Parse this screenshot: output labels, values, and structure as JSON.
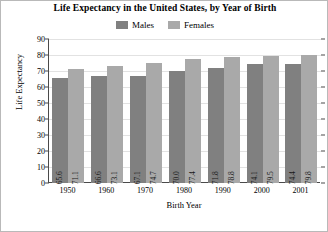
{
  "chart_data": {
    "type": "bar",
    "title": "Life Expectancy in the United States, by Year of Birth",
    "xlabel": "Birth Year",
    "ylabel": "Life Expectancy",
    "categories": [
      "1950",
      "1960",
      "1970",
      "1980",
      "1990",
      "2000",
      "2001"
    ],
    "series": [
      {
        "name": "Males",
        "color": "#808080",
        "values": [
          65.6,
          66.6,
          67.1,
          70.0,
          71.8,
          74.1,
          74.4
        ],
        "labels": [
          "65.6",
          "66.6",
          "67.1",
          "70.0",
          "71.8",
          "74.1",
          "74.4"
        ]
      },
      {
        "name": "Females",
        "color": "#a9a9a9",
        "values": [
          71.1,
          73.1,
          74.7,
          77.4,
          78.8,
          79.5,
          79.8
        ],
        "labels": [
          "71.1",
          "73.1",
          "74.7",
          "77.4",
          "78.8",
          "79.5",
          "79.8"
        ]
      }
    ],
    "ylim": [
      0,
      90
    ],
    "yticks": [
      0,
      10,
      20,
      30,
      40,
      50,
      60,
      70,
      80,
      90
    ],
    "ytick_labels": [
      "0",
      "10",
      "20",
      "30",
      "40",
      "50",
      "60",
      "70",
      "80",
      "90"
    ],
    "grid": true,
    "legend_position": "top-center",
    "bar_label_orientation": "vertical"
  },
  "legend": {
    "items": [
      {
        "label": "Males",
        "color": "#808080"
      },
      {
        "label": "Females",
        "color": "#a9a9a9"
      }
    ]
  }
}
